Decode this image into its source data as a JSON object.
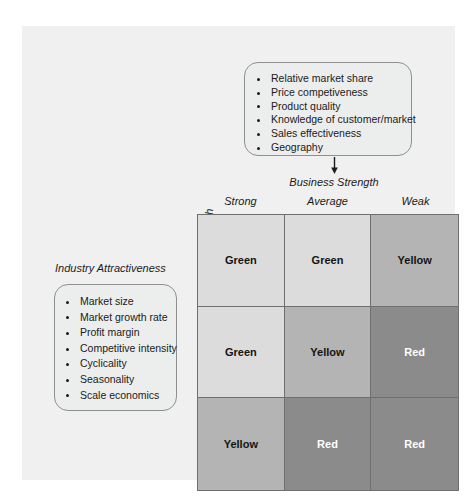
{
  "diagram": {
    "business_strength": {
      "axis_label": "Business Strength",
      "factors": [
        "Relative market share",
        "Price competiveness",
        "Product quality",
        "Knowledge of customer/market",
        "Sales effectiveness",
        "Geography"
      ]
    },
    "industry_attractiveness": {
      "axis_label": "Industry Attractiveness",
      "factors": [
        "Market size",
        "Market growth rate",
        "Profit margin",
        "Competitive intensity",
        "Cyclicality",
        "Seasonality",
        "Scale economics"
      ]
    },
    "matrix": {
      "column_headers": [
        "Strong",
        "Average",
        "Weak"
      ],
      "row_headers": [
        "High",
        "Medium",
        "Low"
      ],
      "cells": [
        {
          "label": "Green",
          "tone": "green"
        },
        {
          "label": "Green",
          "tone": "green"
        },
        {
          "label": "Yellow",
          "tone": "yellow"
        },
        {
          "label": "Green",
          "tone": "green"
        },
        {
          "label": "Yellow",
          "tone": "yellow"
        },
        {
          "label": "Red",
          "tone": "red"
        },
        {
          "label": "Yellow",
          "tone": "yellow"
        },
        {
          "label": "Red",
          "tone": "red"
        },
        {
          "label": "Red",
          "tone": "red"
        }
      ]
    },
    "colors": {
      "panel_background": "#f0f0f0",
      "box_fill": "#eceded",
      "box_border": "#8d8f91",
      "green_cell": "#dcdcdc",
      "yellow_cell": "#b4b4b4",
      "red_cell": "#8b8b8b",
      "grid_line": "#6d6f70"
    }
  }
}
